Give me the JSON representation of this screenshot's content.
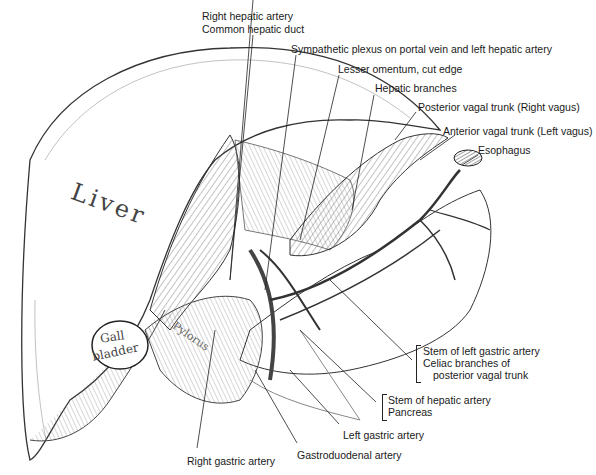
{
  "figure": {
    "type": "anatomical illustration",
    "colors": {
      "ink": "#1a1a1a",
      "shading": "#555555",
      "background": "#ffffff"
    }
  },
  "organ_labels": {
    "liver": "Liver",
    "gall_bladder_1": "Gall",
    "gall_bladder_2": "bladder",
    "pylorus": "Pylorus"
  },
  "labels": {
    "right_hepatic_artery": "Right hepatic artery",
    "common_hepatic_duct": "Common hepatic duct",
    "sympathetic_plexus": "Sympathetic plexus on portal vein and left hepatic artery",
    "lesser_omentum": "Lesser omentum, cut edge",
    "hepatic_branches": "Hepatic branches",
    "posterior_vagal_trunk": "Posterior vagal trunk (Right vagus)",
    "anterior_vagal_trunk": "Anterior vagal trunk (Left vagus)",
    "esophagus": "Esophagus",
    "stem_left_gastric": "Stem of left gastric artery",
    "celiac_branches_1": "Celiac branches of",
    "celiac_branches_2": "posterior vagal trunk",
    "stem_hepatic_artery": "Stem of hepatic artery",
    "pancreas": "Pancreas",
    "left_gastric_artery": "Left gastric artery",
    "gastroduodenal_artery": "Gastroduodenal artery",
    "right_gastric_artery": "Right gastric artery"
  }
}
